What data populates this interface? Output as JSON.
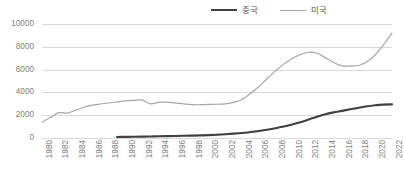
{
  "legend": {
    "position": "top-right",
    "items": [
      {
        "label": "중국",
        "color": "#3f3f3f",
        "name": "china"
      },
      {
        "label": "미국",
        "color": "#a6a6a6",
        "name": "usa"
      }
    ]
  },
  "axes": {
    "y_ticks": [
      "0",
      "2000",
      "4000",
      "6000",
      "8000",
      "10000"
    ],
    "x_ticks": [
      "1980",
      "1982",
      "1984",
      "1986",
      "1988",
      "1990",
      "1992",
      "1994",
      "1996",
      "1998",
      "2000",
      "2002",
      "2004",
      "2006",
      "2008",
      "2010",
      "2012",
      "2014",
      "2016",
      "2018",
      "2020",
      "2022"
    ]
  },
  "colors": {
    "china_line": "#3f3f3f",
    "usa_line": "#a6a6a6",
    "gridline": "#d9d9d9",
    "tick_text": "#808080",
    "legend_text": "#595959",
    "background": "#ffffff"
  },
  "chart_data": {
    "type": "line",
    "title": "",
    "subtitle": "",
    "xlabel": "",
    "ylabel": "",
    "xlim": [
      1980,
      2022
    ],
    "ylim": [
      0,
      10000
    ],
    "y_ticks": [
      0,
      2000,
      4000,
      6000,
      8000,
      10000
    ],
    "x_tick_step": 2,
    "grid": "horizontal",
    "legend_position": "top-right",
    "x": [
      1980,
      1981,
      1982,
      1983,
      1984,
      1985,
      1986,
      1987,
      1988,
      1989,
      1990,
      1991,
      1992,
      1993,
      1994,
      1995,
      1996,
      1997,
      1998,
      1999,
      2000,
      2001,
      2002,
      2003,
      2004,
      2005,
      2006,
      2007,
      2008,
      2009,
      2010,
      2011,
      2012,
      2013,
      2014,
      2015,
      2016,
      2017,
      2018,
      2019,
      2020,
      2021,
      2022
    ],
    "series": [
      {
        "name": "중국",
        "color": "#3f3f3f",
        "values": [
          null,
          null,
          null,
          null,
          null,
          null,
          null,
          null,
          null,
          90,
          100,
          110,
          120,
          135,
          150,
          165,
          180,
          195,
          210,
          230,
          255,
          290,
          330,
          380,
          440,
          520,
          610,
          720,
          860,
          1010,
          1180,
          1380,
          1620,
          1870,
          2090,
          2250,
          2380,
          2520,
          2660,
          2780,
          2880,
          2930,
          2950
        ]
      },
      {
        "name": "미국",
        "color": "#a6a6a6",
        "values": [
          1400,
          1800,
          2220,
          2180,
          2420,
          2700,
          2880,
          2980,
          3070,
          3160,
          3260,
          3300,
          3320,
          3000,
          3120,
          3150,
          3060,
          2990,
          2930,
          2920,
          2950,
          2960,
          3000,
          3120,
          3380,
          3900,
          4500,
          5200,
          5870,
          6480,
          6950,
          7330,
          7520,
          7430,
          7050,
          6620,
          6330,
          6320,
          6360,
          6680,
          7300,
          8200,
          9200
        ]
      }
    ]
  }
}
